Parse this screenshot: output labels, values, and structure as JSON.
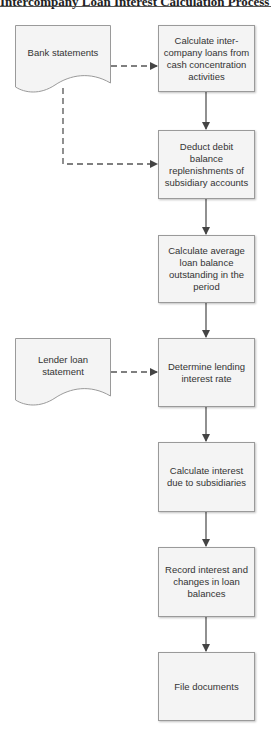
{
  "header": {
    "title": "Intercompany Loan Interest Calculation Process Flow"
  },
  "documents": [
    {
      "id": "bank",
      "label": "Bank statements"
    },
    {
      "id": "lender",
      "label": "Lender loan statement"
    }
  ],
  "steps": [
    {
      "label": "Calculate inter-company loans from cash concentration activities"
    },
    {
      "label": "Deduct debit balance replenishments of subsidiary accounts"
    },
    {
      "label": "Calculate average loan balance outstanding in the period"
    },
    {
      "label": "Determine lending interest rate"
    },
    {
      "label": "Calculate interest due to subsidiaries"
    },
    {
      "label": "Record interest and changes in loan balances"
    },
    {
      "label": "File documents"
    }
  ],
  "colors": {
    "box_fill": "#f4f4f4",
    "box_border": "#9a9a9a",
    "arrow": "#444444",
    "text": "#333333"
  }
}
